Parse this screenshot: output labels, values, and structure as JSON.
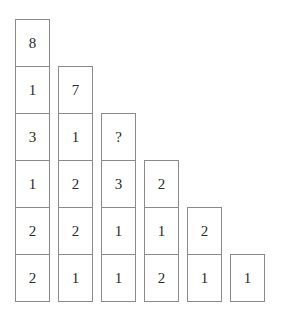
{
  "diagram": {
    "type": "number-pyramid-puzzle",
    "unknown_symbol": "?",
    "columns": [
      {
        "name": "column-1",
        "cells": [
          "8",
          "1",
          "3",
          "1",
          "2",
          "2"
        ]
      },
      {
        "name": "column-2",
        "cells": [
          "7",
          "1",
          "2",
          "2",
          "1"
        ]
      },
      {
        "name": "column-3",
        "cells": [
          "?",
          "3",
          "1",
          "1"
        ]
      },
      {
        "name": "column-4",
        "cells": [
          "2",
          "1",
          "2"
        ]
      },
      {
        "name": "column-5",
        "cells": [
          "2",
          "1"
        ]
      },
      {
        "name": "column-6",
        "cells": [
          "1"
        ]
      }
    ],
    "colors": {
      "border": "#8a8a8a",
      "text": "#2b2b2b",
      "background": "#ffffff"
    }
  }
}
